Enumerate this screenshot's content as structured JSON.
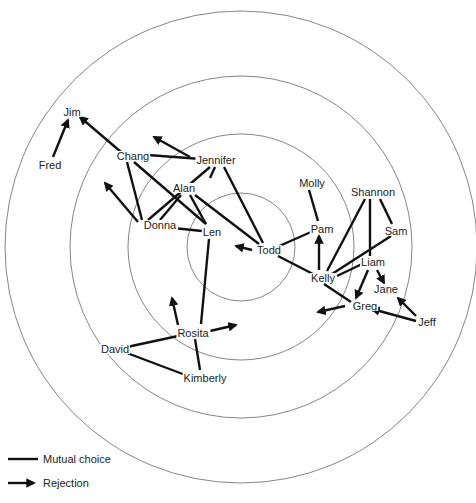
{
  "colors": {
    "edge": "#111111",
    "ring": "#777777",
    "text": "#222222",
    "background": "#ffffff"
  },
  "rings": {
    "center": [
      241,
      247
    ],
    "radii": [
      54,
      113,
      171,
      236
    ]
  },
  "nodes": [
    {
      "id": "Jim",
      "label": "Jim",
      "x": 72,
      "y": 112
    },
    {
      "id": "Fred",
      "label": "Fred",
      "x": 50,
      "y": 165
    },
    {
      "id": "Chang",
      "label": "Chang",
      "x": 133,
      "y": 156
    },
    {
      "id": "Jennifer",
      "label": "Jennifer",
      "x": 216,
      "y": 160
    },
    {
      "id": "Alan",
      "label": "Alan",
      "x": 184,
      "y": 188
    },
    {
      "id": "Donna",
      "label": "Donna",
      "x": 160,
      "y": 225
    },
    {
      "id": "Len",
      "label": "Len",
      "x": 212,
      "y": 232
    },
    {
      "id": "Todd",
      "label": "Todd",
      "x": 269,
      "y": 250
    },
    {
      "id": "Molly",
      "label": "Molly",
      "x": 312,
      "y": 183
    },
    {
      "id": "Pam",
      "label": "Pam",
      "x": 322,
      "y": 229
    },
    {
      "id": "Shannon",
      "label": "Shannon",
      "x": 373,
      "y": 192
    },
    {
      "id": "Sam",
      "label": "Sam",
      "x": 396,
      "y": 231
    },
    {
      "id": "Liam",
      "label": "Liam",
      "x": 373,
      "y": 262
    },
    {
      "id": "Kelly",
      "label": "Kelly",
      "x": 323,
      "y": 278
    },
    {
      "id": "Jane",
      "label": "Jane",
      "x": 386,
      "y": 289
    },
    {
      "id": "Greg",
      "label": "Greg",
      "x": 365,
      "y": 306
    },
    {
      "id": "Jeff",
      "label": "Jeff",
      "x": 427,
      "y": 322
    },
    {
      "id": "Rosita",
      "label": "Rosita",
      "x": 193,
      "y": 333
    },
    {
      "id": "David",
      "label": "David",
      "x": 115,
      "y": 349
    },
    {
      "id": "Kimberly",
      "label": "Kimberly",
      "x": 205,
      "y": 378
    }
  ],
  "mutual_choices": [
    [
      "Chang",
      "Jennifer"
    ],
    [
      "Chang",
      "Donna"
    ],
    [
      "Chang",
      "Len"
    ],
    [
      "Jennifer",
      "Donna"
    ],
    [
      "Jennifer",
      "Alan"
    ],
    [
      "Jennifer",
      "Todd"
    ],
    [
      "Alan",
      "Donna"
    ],
    [
      "Alan",
      "Len"
    ],
    [
      "Alan",
      "Todd"
    ],
    [
      "Donna",
      "Len"
    ],
    [
      "Todd",
      "Pam"
    ],
    [
      "Todd",
      "Kelly"
    ],
    [
      "Molly",
      "Pam"
    ],
    [
      "Shannon",
      "Kelly"
    ],
    [
      "Shannon",
      "Liam"
    ],
    [
      "Shannon",
      "Sam"
    ],
    [
      "Sam",
      "Kelly"
    ],
    [
      "Liam",
      "Kelly"
    ],
    [
      "Kelly",
      "Greg"
    ],
    [
      "Len",
      "Rosita"
    ],
    [
      "Rosita",
      "David"
    ],
    [
      "Rosita",
      "Kimberly"
    ],
    [
      "David",
      "Kimberly"
    ]
  ],
  "rejections": [
    {
      "from": "Fred",
      "to": "Jim",
      "x1": 53,
      "y1": 157,
      "x2": 68,
      "y2": 120
    },
    {
      "from": "Chang",
      "to": "Jim",
      "x1": 121,
      "y1": 152,
      "x2": 80,
      "y2": 117
    },
    {
      "from": "Jennifer",
      "to": null,
      "x1": 190,
      "y1": 157,
      "x2": 154,
      "y2": 137
    },
    {
      "from": "Donna",
      "to": null,
      "x1": 138,
      "y1": 222,
      "x2": 105,
      "y2": 183
    },
    {
      "from": "Todd",
      "to": null,
      "x1": 252,
      "y1": 250,
      "x2": 236,
      "y2": 246
    },
    {
      "from": "Kelly",
      "to": "Pam",
      "x1": 319,
      "y1": 270,
      "x2": 319,
      "y2": 236
    },
    {
      "from": "Liam",
      "to": "Greg",
      "x1": 368,
      "y1": 270,
      "x2": 356,
      "y2": 298
    },
    {
      "from": "Liam",
      "to": "Jane",
      "x1": 377,
      "y1": 270,
      "x2": 384,
      "y2": 283
    },
    {
      "from": "Greg",
      "to": null,
      "x1": 345,
      "y1": 306,
      "x2": 318,
      "y2": 312
    },
    {
      "from": "Jeff",
      "to": "Greg",
      "x1": 416,
      "y1": 321,
      "x2": 372,
      "y2": 309
    },
    {
      "from": "Jeff",
      "to": "Jane",
      "x1": 416,
      "y1": 316,
      "x2": 398,
      "y2": 298
    },
    {
      "from": "Rosita",
      "to": null,
      "x1": 178,
      "y1": 325,
      "x2": 172,
      "y2": 298
    },
    {
      "from": "Rosita",
      "to": null,
      "x1": 210,
      "y1": 331,
      "x2": 236,
      "y2": 325
    }
  ],
  "mutual_line_coords": [
    [
      148,
      155,
      201,
      159
    ],
    [
      127,
      162,
      142,
      220
    ],
    [
      134,
      162,
      206,
      224
    ],
    [
      210,
      167,
      148,
      220
    ],
    [
      215,
      167,
      210,
      178
    ],
    [
      224,
      167,
      263,
      243
    ],
    [
      181,
      195,
      160,
      220
    ],
    [
      190,
      195,
      206,
      224
    ],
    [
      195,
      195,
      259,
      244
    ],
    [
      173,
      228,
      202,
      231
    ],
    [
      277,
      247,
      311,
      232
    ],
    [
      278,
      256,
      313,
      274
    ],
    [
      309,
      190,
      318,
      221
    ],
    [
      365,
      199,
      327,
      271
    ],
    [
      370,
      199,
      370,
      256
    ],
    [
      380,
      199,
      392,
      224
    ],
    [
      391,
      236,
      332,
      274
    ],
    [
      362,
      264,
      337,
      276
    ],
    [
      324,
      284,
      351,
      302
    ],
    [
      209,
      239,
      201,
      324
    ],
    [
      178,
      336,
      127,
      347
    ],
    [
      195,
      339,
      200,
      370
    ],
    [
      127,
      353,
      188,
      376
    ]
  ],
  "legend": {
    "items": [
      {
        "type": "mutual",
        "label": "Mutual choice"
      },
      {
        "type": "rejection",
        "label": "Rejection"
      }
    ]
  }
}
